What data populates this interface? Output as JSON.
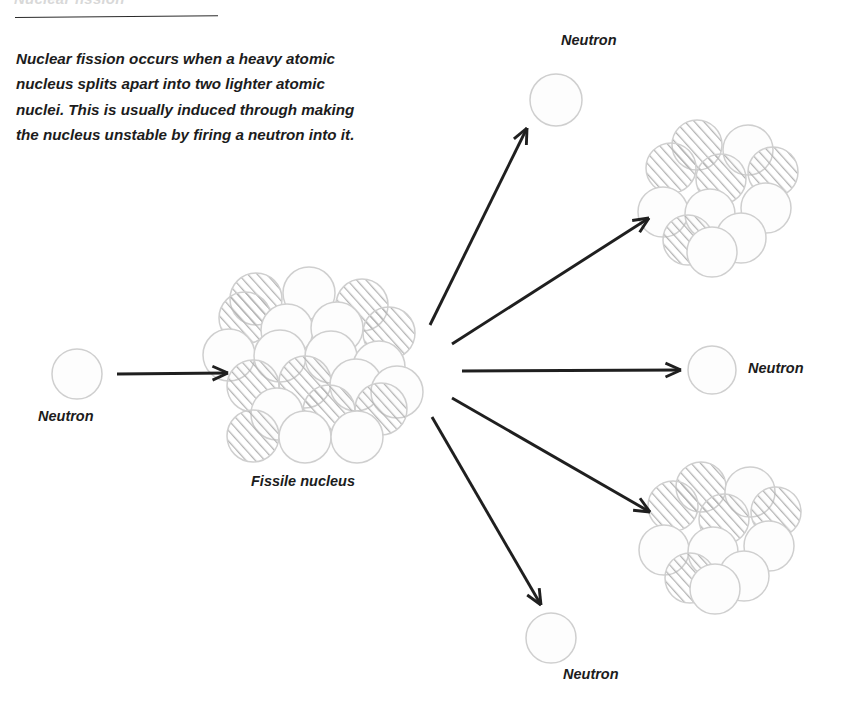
{
  "figure": {
    "title": "Nuclear fission",
    "body_text": "Nuclear fission occurs when a heavy atomic nucleus splits apart into two lighter atomic nuclei. This is usually induced through making the nucleus unstable by firing a neutron into it.",
    "labels": {
      "neutron_incoming": "Neutron",
      "fissile_nucleus": "Fissile nucleus",
      "neutron_top": "Neutron",
      "neutron_right": "Neutron",
      "neutron_bottom": "Neutron"
    },
    "colors": {
      "ink": "#1c1c1c",
      "arrow": "#1f1f1f",
      "nucleon_outline": "#cfcfcf",
      "proton_hatch": "#b4b4b4",
      "neutron_fill": "#fdfdfd",
      "background": "#ffffff"
    },
    "diagram": {
      "type": "process-diagram",
      "description": "A free neutron travels right and strikes a large fissile nucleus, which splits into two smaller nuclei and releases three free neutrons.",
      "nucleon_legend": [
        {
          "name": "proton",
          "style": "diagonal-hatched circle"
        },
        {
          "name": "neutron",
          "style": "plain light outlined circle"
        }
      ],
      "incoming_neutron": {
        "cx": 77,
        "cy": 374,
        "r": 25
      },
      "fissile_nucleus": {
        "center": [
          311,
          365
        ],
        "nucleon_count": 21,
        "nucleon_radius": 26,
        "nucleons": [
          {
            "x": 256,
            "y": 299,
            "type": "proton"
          },
          {
            "x": 309,
            "y": 293,
            "type": "neutron"
          },
          {
            "x": 362,
            "y": 305,
            "type": "proton"
          },
          {
            "x": 245,
            "y": 318,
            "type": "proton"
          },
          {
            "x": 389,
            "y": 333,
            "type": "proton"
          },
          {
            "x": 287,
            "y": 330,
            "type": "neutron"
          },
          {
            "x": 337,
            "y": 328,
            "type": "neutron"
          },
          {
            "x": 229,
            "y": 355,
            "type": "neutron"
          },
          {
            "x": 280,
            "y": 356,
            "type": "neutron"
          },
          {
            "x": 331,
            "y": 357,
            "type": "neutron"
          },
          {
            "x": 379,
            "y": 367,
            "type": "neutron"
          },
          {
            "x": 253,
            "y": 386,
            "type": "proton"
          },
          {
            "x": 305,
            "y": 382,
            "type": "proton"
          },
          {
            "x": 356,
            "y": 385,
            "type": "neutron"
          },
          {
            "x": 397,
            "y": 392,
            "type": "neutron"
          },
          {
            "x": 277,
            "y": 414,
            "type": "neutron"
          },
          {
            "x": 329,
            "y": 411,
            "type": "proton"
          },
          {
            "x": 381,
            "y": 409,
            "type": "proton"
          },
          {
            "x": 253,
            "y": 436,
            "type": "proton"
          },
          {
            "x": 305,
            "y": 437,
            "type": "neutron"
          },
          {
            "x": 357,
            "y": 437,
            "type": "neutron"
          }
        ]
      },
      "fragment_top_right": {
        "center": [
          718,
          192
        ],
        "nucleon_count": 11,
        "nucleon_radius": 25,
        "nucleons": [
          {
            "x": 697,
            "y": 145,
            "type": "proton"
          },
          {
            "x": 748,
            "y": 150,
            "type": "neutron"
          },
          {
            "x": 671,
            "y": 168,
            "type": "proton"
          },
          {
            "x": 773,
            "y": 172,
            "type": "proton"
          },
          {
            "x": 721,
            "y": 179,
            "type": "proton"
          },
          {
            "x": 663,
            "y": 212,
            "type": "neutron"
          },
          {
            "x": 710,
            "y": 214,
            "type": "neutron"
          },
          {
            "x": 766,
            "y": 208,
            "type": "neutron"
          },
          {
            "x": 688,
            "y": 240,
            "type": "proton"
          },
          {
            "x": 741,
            "y": 238,
            "type": "neutron"
          },
          {
            "x": 712,
            "y": 252,
            "type": "neutron"
          }
        ]
      },
      "fragment_bottom_right": {
        "center": [
          720,
          530
        ],
        "nucleon_count": 11,
        "nucleon_radius": 25,
        "nucleons": [
          {
            "x": 701,
            "y": 487,
            "type": "proton"
          },
          {
            "x": 750,
            "y": 492,
            "type": "neutron"
          },
          {
            "x": 673,
            "y": 506,
            "type": "proton"
          },
          {
            "x": 776,
            "y": 512,
            "type": "proton"
          },
          {
            "x": 724,
            "y": 519,
            "type": "proton"
          },
          {
            "x": 664,
            "y": 550,
            "type": "neutron"
          },
          {
            "x": 713,
            "y": 552,
            "type": "neutron"
          },
          {
            "x": 769,
            "y": 546,
            "type": "neutron"
          },
          {
            "x": 690,
            "y": 578,
            "type": "proton"
          },
          {
            "x": 744,
            "y": 576,
            "type": "neutron"
          },
          {
            "x": 715,
            "y": 589,
            "type": "neutron"
          }
        ]
      },
      "emitted_neutrons": [
        {
          "id": "neutron-top",
          "cx": 556,
          "cy": 100,
          "r": 26
        },
        {
          "id": "neutron-right",
          "cx": 712,
          "cy": 370,
          "r": 24
        },
        {
          "id": "neutron-bottom",
          "cx": 551,
          "cy": 638,
          "r": 25
        }
      ],
      "arrows": [
        {
          "id": "arrow-incoming",
          "from": [
            117,
            374
          ],
          "to": [
            228,
            373
          ]
        },
        {
          "id": "arrow-to-neutron-top",
          "from": [
            430,
            325
          ],
          "to": [
            527,
            128
          ]
        },
        {
          "id": "arrow-to-fragment-top",
          "from": [
            452,
            344
          ],
          "to": [
            649,
            218
          ]
        },
        {
          "id": "arrow-to-neutron-right",
          "from": [
            462,
            371
          ],
          "to": [
            681,
            370
          ]
        },
        {
          "id": "arrow-to-fragment-bottom",
          "from": [
            452,
            398
          ],
          "to": [
            650,
            512
          ]
        },
        {
          "id": "arrow-to-neutron-bottom",
          "from": [
            432,
            417
          ],
          "to": [
            541,
            605
          ]
        }
      ]
    }
  }
}
